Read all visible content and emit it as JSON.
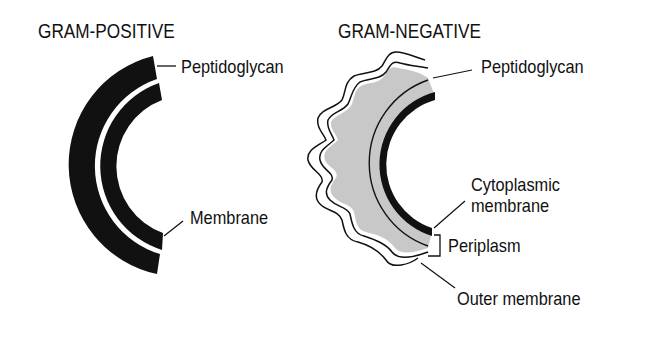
{
  "panels": {
    "gram_positive": {
      "title": "GRAM-POSITIVE",
      "labels": {
        "peptidoglycan": "Peptidoglycan",
        "membrane": "Membrane"
      }
    },
    "gram_negative": {
      "title": "GRAM-NEGATIVE",
      "labels": {
        "peptidoglycan": "Peptidoglycan",
        "cytoplasmic_membrane_line1": "Cytoplasmic",
        "cytoplasmic_membrane_line2": "membrane",
        "periplasm": "Periplasm",
        "outer_membrane": "Outer membrane"
      }
    }
  },
  "colors": {
    "ink": "#111111",
    "periplasm_fill": "#c8c8c8",
    "background": "#ffffff"
  }
}
